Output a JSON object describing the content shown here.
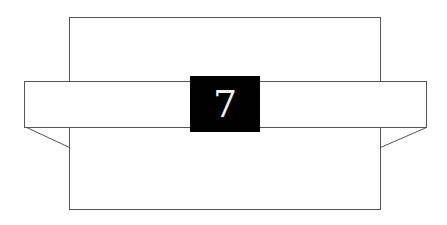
{
  "diagram": {
    "label": "7",
    "colors": {
      "stroke": "#555555",
      "label_bg": "#000000",
      "label_fg": "#f0f0f0",
      "background": "#ffffff"
    }
  }
}
